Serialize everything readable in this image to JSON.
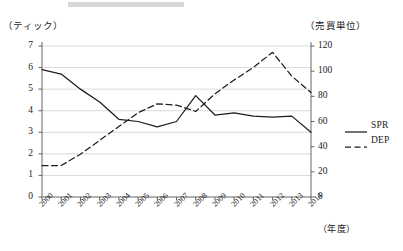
{
  "chart_data": {
    "type": "line",
    "title": "",
    "xlabel": "（年度）",
    "ylabel": "（ティック）",
    "y2label": "（売買単位）",
    "grid": true,
    "legend_position": "right",
    "x": [
      "2000",
      "2001",
      "2002",
      "2003",
      "2004",
      "2005",
      "2006",
      "2007",
      "2008",
      "2009",
      "2010",
      "2011",
      "2012",
      "2013",
      "2014"
    ],
    "ylim": [
      0,
      7
    ],
    "yticks": [
      0,
      1,
      2,
      3,
      4,
      5,
      6,
      7
    ],
    "y2lim": [
      0,
      120
    ],
    "y2ticks": [
      0,
      20,
      40,
      60,
      80,
      100,
      120
    ],
    "series": [
      {
        "name": "SPR",
        "axis": "left",
        "style": "solid",
        "values": [
          5.9,
          5.7,
          5.0,
          4.4,
          3.6,
          3.5,
          3.25,
          3.5,
          4.7,
          3.8,
          3.9,
          3.75,
          3.7,
          3.75,
          3.0
        ]
      },
      {
        "name": "DEP",
        "axis": "right",
        "style": "dashed",
        "values": [
          25,
          25,
          34,
          45,
          56,
          67,
          74,
          73,
          68,
          82,
          93,
          103,
          115,
          96,
          83
        ]
      }
    ]
  },
  "legend": {
    "items": [
      {
        "label": "SPR",
        "style": "solid"
      },
      {
        "label": "DEP",
        "style": "dashed"
      }
    ]
  },
  "axes": {
    "left_caption": "（ティック）",
    "right_caption": "（売買単位）",
    "x_caption": "（年度）"
  }
}
